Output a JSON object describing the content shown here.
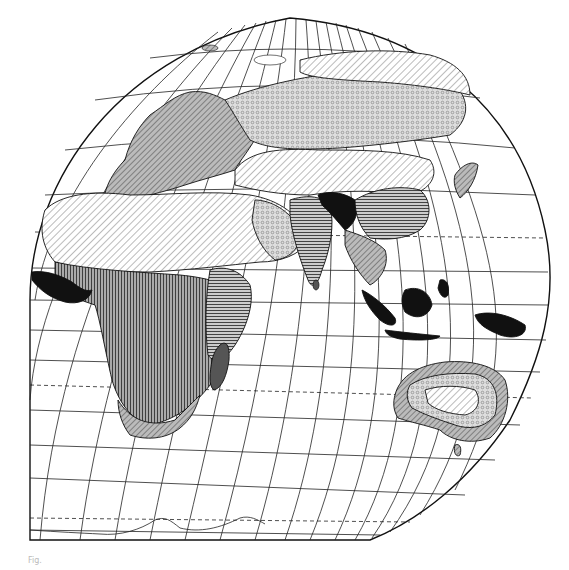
{
  "map": {
    "title": "",
    "projection": "Eastern Hemisphere, interrupted pseudo-conic projection",
    "style": "black-and-white vegetation / climate zones with hatching patterns",
    "regions": [
      {
        "name": "Europe",
        "pattern": "diagonal-hatch-gray"
      },
      {
        "name": "Siberia",
        "pattern": "circle-dots"
      },
      {
        "name": "Central Asia",
        "pattern": "diagonal-hatch-light"
      },
      {
        "name": "Sahara / Arabia",
        "pattern": "diagonal-hatch-light"
      },
      {
        "name": "West Africa coast",
        "pattern": "solid-black"
      },
      {
        "name": "Central Africa",
        "pattern": "vertical-hatch"
      },
      {
        "name": "East Africa",
        "pattern": "horizontal-hatch"
      },
      {
        "name": "Southern Africa",
        "pattern": "mixed-hatch"
      },
      {
        "name": "Madagascar",
        "pattern": "gray-black"
      },
      {
        "name": "India",
        "pattern": "horizontal-hatch"
      },
      {
        "name": "Himalaya / Bengal",
        "pattern": "solid-black"
      },
      {
        "name": "China",
        "pattern": "horizontal-hatch"
      },
      {
        "name": "Japan",
        "pattern": "diagonal-hatch-gray"
      },
      {
        "name": "Indonesia / New Guinea",
        "pattern": "solid-black"
      },
      {
        "name": "Australia interior",
        "pattern": "diagonal-hatch-light"
      },
      {
        "name": "Australia belt",
        "pattern": "circle-dots"
      },
      {
        "name": "Australia coast",
        "pattern": "diagonal-hatch-gray"
      },
      {
        "name": "Antarctica coastline",
        "pattern": "outline"
      }
    ],
    "caption": "Fig."
  }
}
